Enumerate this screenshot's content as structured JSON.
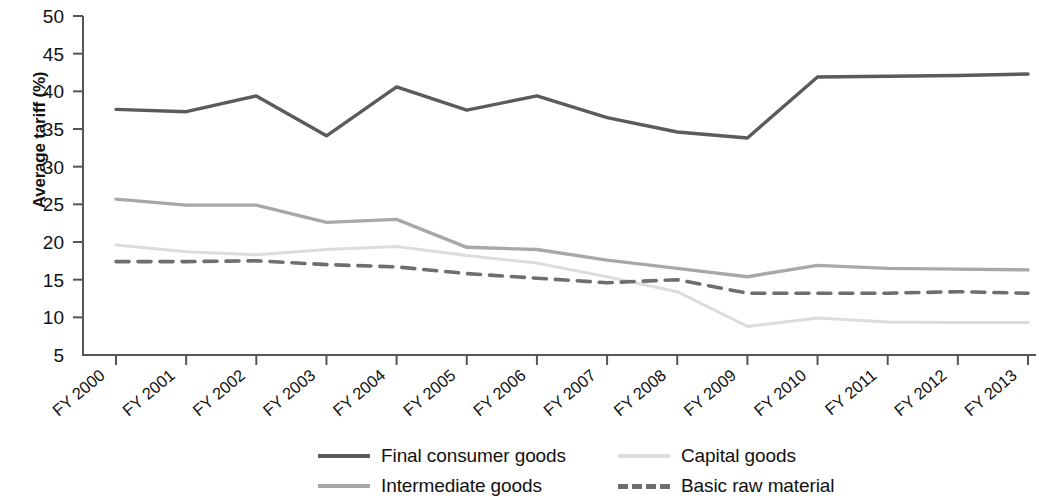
{
  "chart_data": {
    "type": "line",
    "title": "",
    "xlabel": "",
    "ylabel": "Average tariff (%)",
    "ylim": [
      5,
      50
    ],
    "ytick_values": [
      5,
      10,
      15,
      20,
      25,
      30,
      35,
      40,
      45,
      50
    ],
    "ytick_labels": [
      "5",
      "10",
      "15",
      "20",
      "25",
      "30",
      "35",
      "40",
      "45",
      "50"
    ],
    "grid": false,
    "legend_position": "bottom",
    "categories": [
      "FY 2000",
      "FY 2001",
      "FY 2002",
      "FY 2003",
      "FY 2004",
      "FY 2005",
      "FY 2006",
      "FY 2007",
      "FY 2008",
      "FY 2009",
      "FY 2010",
      "FY 2011",
      "FY 2012",
      "FY 2013"
    ],
    "series": [
      {
        "name": "Final consumer goods",
        "color": "#5b5b5b",
        "style": "solid",
        "width": 3.4,
        "values": [
          37.6,
          37.3,
          39.4,
          34.1,
          40.6,
          37.5,
          39.4,
          36.5,
          34.6,
          33.8,
          41.9,
          42.0,
          42.1,
          42.3
        ]
      },
      {
        "name": "Intermediate goods",
        "color": "#a8a8a8",
        "style": "solid",
        "width": 3.4,
        "values": [
          25.7,
          24.9,
          24.9,
          22.6,
          23.0,
          19.3,
          19.0,
          17.6,
          16.5,
          15.4,
          16.9,
          16.5,
          16.4,
          16.3
        ]
      },
      {
        "name": "Capital goods",
        "color": "#dcdcdc",
        "style": "solid",
        "width": 3.0,
        "values": [
          19.6,
          18.7,
          18.3,
          19.0,
          19.4,
          18.2,
          17.2,
          15.4,
          13.4,
          8.8,
          9.9,
          9.4,
          9.3,
          9.3
        ]
      },
      {
        "name": "Basic raw material",
        "color": "#6e6e6e",
        "style": "dashed",
        "width": 3.6,
        "values": [
          17.4,
          17.4,
          17.5,
          17.0,
          16.7,
          15.8,
          15.2,
          14.6,
          15.0,
          13.2,
          13.2,
          13.2,
          13.4,
          13.2
        ]
      }
    ]
  },
  "legend": {
    "items": [
      {
        "label": "Final consumer goods",
        "color": "#5b5b5b",
        "style": "solid"
      },
      {
        "label": "Capital goods",
        "color": "#dcdcdc",
        "style": "solid"
      },
      {
        "label": "Intermediate goods",
        "color": "#a8a8a8",
        "style": "solid"
      },
      {
        "label": "Basic raw material",
        "color": "#6e6e6e",
        "style": "dashed"
      }
    ]
  },
  "axes": {
    "y_title": "Average tariff (%)",
    "axis_color": "#555555"
  }
}
